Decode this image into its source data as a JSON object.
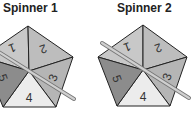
{
  "spinners": [
    {
      "title": "Spinner 1",
      "sections": [
        {
          "label": "1",
          "color": "#c8c8c8"
        },
        {
          "label": "2",
          "color": "#bdbdbd"
        },
        {
          "label": "3",
          "color": "#b5b5b5"
        },
        {
          "label": "4",
          "color": "#ececec"
        },
        {
          "label": "5",
          "color": "#8c8c8c"
        }
      ],
      "pointer_toward": "between 3 and 4"
    },
    {
      "title": "Spinner 2",
      "sections": [
        {
          "label": "1",
          "color": "#c8c8c8"
        },
        {
          "label": "2",
          "color": "#bdbdbd"
        },
        {
          "label": "3",
          "color": "#b5b5b5"
        },
        {
          "label": "4",
          "color": "#ececec"
        },
        {
          "label": "5",
          "color": "#8c8c8c"
        }
      ],
      "pointer_toward": "between 3 and 4"
    }
  ]
}
